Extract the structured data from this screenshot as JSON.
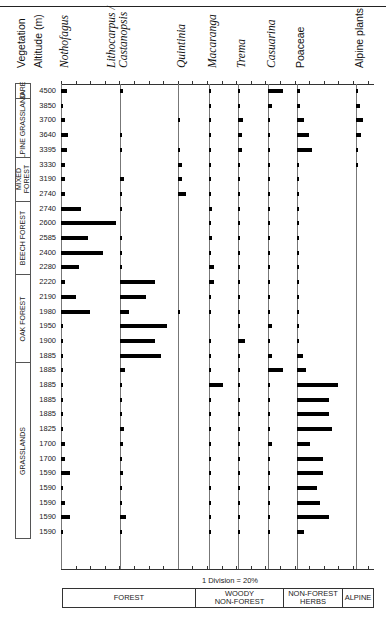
{
  "chart_data": {
    "type": "bar",
    "subtype": "pollen-percentage-diagram",
    "title": "",
    "xlabel": "1 Division = 20%",
    "ylabel": "Altitude (m)",
    "scale_note": "1 Division = 20%",
    "percent_per_division": 20,
    "header_labels": {
      "vegetation": "Vegetation",
      "altitude": "Altitude (m)"
    },
    "altitudes": [
      4500,
      3850,
      3700,
      3640,
      3395,
      3330,
      3190,
      2740,
      2740,
      2600,
      2585,
      2400,
      2280,
      2220,
      2190,
      1980,
      1950,
      1900,
      1885,
      1885,
      1885,
      1885,
      1885,
      1825,
      1700,
      1700,
      1590,
      1590,
      1590,
      1590,
      1590
    ],
    "vegetation_zones": [
      {
        "label": "BARE",
        "from_row": 0,
        "to_row": 0
      },
      {
        "label": "ALPINE GRASSLAND",
        "from_row": 1,
        "to_row": 4
      },
      {
        "label": "MIXED FOREST",
        "from_row": 5,
        "to_row": 7
      },
      {
        "label": "BEECH FOREST",
        "from_row": 8,
        "to_row": 12
      },
      {
        "label": "OAK FOREST",
        "from_row": 13,
        "to_row": 18
      },
      {
        "label": "GRASSLANDS",
        "from_row": 19,
        "to_row": 30
      }
    ],
    "series": [
      {
        "name": "Nothofagus",
        "italic": true,
        "group": "FOREST",
        "values": [
          8,
          3,
          6,
          10,
          8,
          5,
          6,
          5,
          28,
          76,
          37,
          57,
          25,
          5,
          20,
          40,
          2,
          3,
          3,
          3,
          1,
          3,
          3,
          3,
          6,
          6,
          12,
          3,
          5,
          12,
          3
        ]
      },
      {
        "name": "Lithocarpus / Castanopsis",
        "italic": true,
        "group": "FOREST",
        "values": [
          4,
          0,
          0,
          2,
          1,
          0,
          5,
          3,
          2,
          0,
          1,
          1,
          1,
          48,
          36,
          12,
          64,
          48,
          56,
          7,
          3,
          2,
          3,
          6,
          4,
          1,
          4,
          1,
          1,
          8,
          1
        ]
      },
      {
        "name": "Quintinia",
        "italic": true,
        "group": "FOREST",
        "values": [
          0,
          0,
          3,
          0,
          1,
          6,
          5,
          11,
          0,
          0,
          0,
          0,
          0,
          0,
          0,
          1,
          0,
          0,
          0,
          0,
          0,
          0,
          0,
          0,
          0,
          0,
          0,
          0,
          0,
          0,
          0
        ]
      },
      {
        "name": "Macaranga",
        "italic": true,
        "group": "WOODY NON-FOREST",
        "values": [
          2,
          1,
          2,
          2,
          2,
          2,
          2,
          2,
          4,
          1,
          4,
          1,
          7,
          7,
          1,
          1,
          0,
          1,
          1,
          1,
          19,
          1,
          1,
          1,
          1,
          2,
          2,
          2,
          2,
          2,
          1
        ]
      },
      {
        "name": "Trema",
        "italic": true,
        "group": "WOODY NON-FOREST",
        "values": [
          2,
          1,
          7,
          5,
          5,
          1,
          1,
          1,
          1,
          1,
          1,
          1,
          1,
          1,
          1,
          1,
          1,
          9,
          1,
          1,
          2,
          2,
          2,
          1,
          1,
          1,
          2,
          2,
          2,
          2,
          1
        ]
      },
      {
        "name": "Casuarina",
        "italic": true,
        "group": "WOODY NON-FOREST",
        "values": [
          20,
          6,
          1,
          1,
          1,
          1,
          3,
          1,
          1,
          1,
          1,
          1,
          1,
          1,
          1,
          1,
          6,
          1,
          6,
          20,
          1,
          2,
          1,
          1,
          6,
          1,
          2,
          1,
          1,
          1,
          1
        ]
      },
      {
        "name": "Poaceae",
        "italic": false,
        "group": "NON-FOREST HERBS",
        "values": [
          4,
          4,
          9,
          16,
          20,
          2,
          3,
          2,
          2,
          2,
          2,
          1,
          1,
          2,
          2,
          3,
          1,
          1,
          8,
          12,
          56,
          44,
          44,
          48,
          18,
          36,
          36,
          28,
          32,
          44,
          10
        ]
      },
      {
        "name": "Alpine plants",
        "italic": false,
        "group": "ALPINE",
        "values": [
          2,
          5,
          10,
          7,
          3,
          3,
          0,
          0,
          0,
          0,
          0,
          0,
          0,
          0,
          0,
          0,
          0,
          0,
          0,
          0,
          0,
          0,
          0,
          0,
          0,
          0,
          0,
          0,
          0,
          0,
          0
        ]
      }
    ],
    "groups": [
      "FOREST",
      "WOODY NON-FOREST",
      "NON-FOREST HERBS",
      "ALPINE"
    ],
    "grid": false,
    "legend_position": "bottom"
  },
  "legend": {
    "forest": "FOREST",
    "woody_line1": "WOODY",
    "woody_line2": "NON-FOREST",
    "herbs_line1": "NON-FOREST",
    "herbs_line2": "HERBS",
    "alpine": "ALPINE"
  }
}
